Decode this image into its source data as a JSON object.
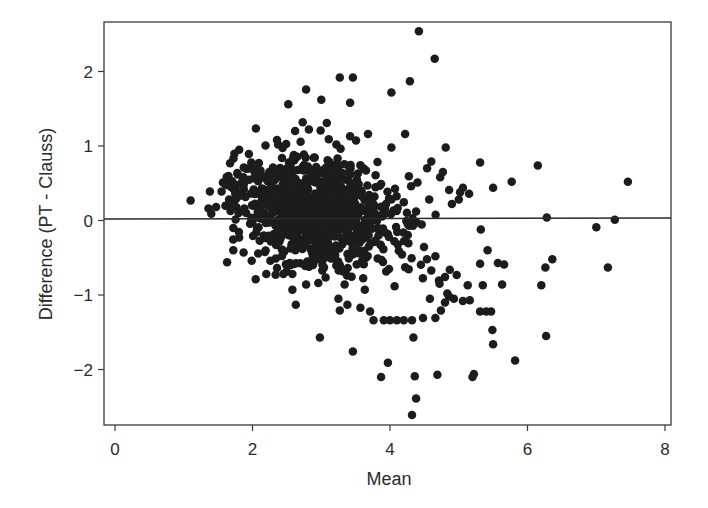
{
  "chart_data": {
    "type": "scatter",
    "title": "",
    "xlabel": "Mean",
    "ylabel": "Difference (PT - Clauss)",
    "xlim": [
      -0.16,
      8.13
    ],
    "ylim": [
      -2.74,
      2.66
    ],
    "xticks": [
      0,
      2,
      4,
      6,
      8
    ],
    "xtick_labels": [
      "0",
      "2",
      "4",
      "6",
      "8"
    ],
    "yticks": [
      -2,
      -1,
      0,
      1,
      2
    ],
    "ytick_labels": [
      "−2",
      "−1",
      "0",
      "1",
      "2"
    ],
    "grid": false,
    "legend": null,
    "reference_line": {
      "y": 0,
      "label": ""
    },
    "marker": {
      "shape": "circle",
      "size_px": 8.5,
      "color": "#1c1c1c"
    },
    "outlier_points": [
      [
        4.42,
        2.54
      ],
      [
        4.65,
        2.17
      ],
      [
        4.29,
        1.87
      ],
      [
        3.27,
        1.92
      ],
      [
        3.46,
        1.92
      ],
      [
        4.02,
        1.72
      ],
      [
        2.78,
        1.76
      ],
      [
        2.52,
        1.56
      ],
      [
        3.0,
        1.62
      ],
      [
        3.42,
        1.58
      ],
      [
        3.42,
        1.13
      ],
      [
        3.68,
        1.16
      ],
      [
        4.22,
        1.16
      ],
      [
        4.02,
        0.98
      ],
      [
        4.81,
        0.98
      ],
      [
        2.73,
        1.32
      ],
      [
        3.08,
        1.31
      ],
      [
        2.82,
        1.22
      ],
      [
        3.22,
        1.02
      ],
      [
        2.62,
        1.2
      ],
      [
        2.6,
        0.88
      ],
      [
        2.99,
        1.21
      ],
      [
        3.11,
        1.09
      ],
      [
        5.31,
        0.78
      ],
      [
        6.15,
        0.74
      ],
      [
        5.77,
        0.52
      ],
      [
        7.46,
        0.52
      ],
      [
        5.5,
        0.44
      ],
      [
        5.06,
        0.44
      ],
      [
        6.28,
        0.04
      ],
      [
        7.27,
        0.01
      ],
      [
        7.0,
        -0.09
      ],
      [
        7.17,
        -0.63
      ],
      [
        6.26,
        -0.63
      ],
      [
        6.36,
        -0.52
      ],
      [
        6.2,
        -0.87
      ],
      [
        5.66,
        -0.59
      ],
      [
        5.57,
        -0.57
      ],
      [
        5.42,
        -0.4
      ],
      [
        5.31,
        -0.58
      ],
      [
        4.97,
        -0.73
      ],
      [
        5.13,
        -0.87
      ],
      [
        5.63,
        -0.86
      ],
      [
        5.35,
        -0.87
      ],
      [
        5.31,
        -1.22
      ],
      [
        5.4,
        -1.22
      ],
      [
        5.47,
        -1.22
      ],
      [
        5.49,
        -1.47
      ],
      [
        5.5,
        -1.66
      ],
      [
        5.82,
        -1.88
      ],
      [
        6.27,
        -1.55
      ],
      [
        5.22,
        -2.06
      ],
      [
        5.2,
        -2.1
      ],
      [
        4.69,
        -2.07
      ],
      [
        4.36,
        -2.09
      ],
      [
        4.38,
        -2.39
      ],
      [
        4.32,
        -2.61
      ],
      [
        3.97,
        -1.91
      ],
      [
        3.87,
        -2.1
      ],
      [
        3.46,
        -1.76
      ],
      [
        2.98,
        -1.57
      ],
      [
        4.32,
        -1.34
      ],
      [
        4.2,
        -1.34
      ],
      [
        4.1,
        -1.34
      ],
      [
        4.0,
        -1.34
      ],
      [
        3.91,
        -1.34
      ],
      [
        3.76,
        -1.34
      ],
      [
        4.34,
        -1.57
      ],
      [
        3.71,
        -1.22
      ],
      [
        3.57,
        -1.17
      ],
      [
        3.27,
        -1.21
      ],
      [
        3.25,
        -1.05
      ],
      [
        3.38,
        -1.13
      ],
      [
        2.63,
        -1.13
      ],
      [
        2.58,
        -0.93
      ],
      [
        2.78,
        -0.86
      ],
      [
        2.58,
        -0.72
      ],
      [
        2.45,
        -0.72
      ],
      [
        2.2,
        -0.72
      ],
      [
        1.72,
        -0.4
      ],
      [
        1.63,
        -0.56
      ],
      [
        1.87,
        -0.43
      ],
      [
        1.1,
        0.27
      ],
      [
        1.38,
        0.39
      ],
      [
        1.57,
        0.51
      ],
      [
        1.55,
        0.39
      ],
      [
        1.4,
        0.09
      ],
      [
        1.36,
        0.16
      ],
      [
        1.47,
        0.18
      ],
      [
        1.66,
        0.28
      ],
      [
        1.76,
        0.48
      ],
      [
        1.88,
        0.16
      ],
      [
        1.72,
        -0.1
      ],
      [
        5.02,
        0.38
      ],
      [
        5.15,
        0.36
      ],
      [
        4.86,
        0.41
      ],
      [
        4.73,
        0.58
      ],
      [
        4.9,
        0.22
      ],
      [
        5.0,
        0.28
      ],
      [
        5.32,
        -0.12
      ],
      [
        4.66,
        -0.48
      ],
      [
        4.6,
        -0.67
      ],
      [
        4.72,
        -0.85
      ],
      [
        4.93,
        -1.05
      ],
      [
        5.06,
        -1.08
      ],
      [
        5.16,
        -1.07
      ],
      [
        4.86,
        -1.02
      ],
      [
        4.58,
        -1.05
      ],
      [
        4.74,
        -1.21
      ],
      [
        4.8,
        -1.1
      ],
      [
        4.66,
        -1.31
      ],
      [
        4.48,
        -1.31
      ],
      [
        4.8,
        -0.76
      ],
      [
        4.87,
        -0.66
      ],
      [
        4.6,
        0.79
      ],
      [
        4.77,
        0.65
      ],
      [
        4.54,
        0.7
      ],
      [
        4.4,
        0.51
      ],
      [
        4.57,
        0.28
      ],
      [
        4.38,
        0.12
      ]
    ],
    "core_cluster": {
      "description": "dense cloud of ~800 overlapping points",
      "x_center": 2.95,
      "x_sd": 0.62,
      "y_center": 0.12,
      "y_sd": 0.36,
      "count": 900,
      "seed": 7
    }
  }
}
